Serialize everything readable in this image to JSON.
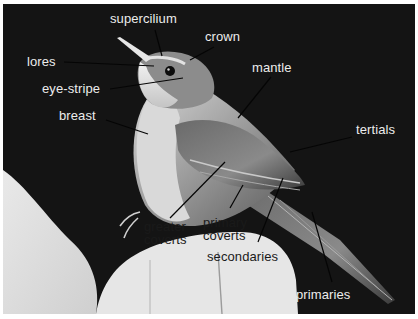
{
  "figure": {
    "background_color": "#141414",
    "label_color_light": "#ececec",
    "label_color_dark": "#1a1a1a"
  },
  "labels": [
    {
      "id": "supercilium",
      "text": "supercilium",
      "x": 110,
      "y": 12,
      "tone": "light",
      "line": [
        155,
        30,
        162,
        56
      ]
    },
    {
      "id": "crown",
      "text": "crown",
      "x": 205,
      "y": 30,
      "tone": "light",
      "line": [
        214,
        47,
        190,
        60
      ]
    },
    {
      "id": "lores",
      "text": "lores",
      "x": 27,
      "y": 55,
      "tone": "light",
      "line": [
        64,
        62,
        154,
        66
      ]
    },
    {
      "id": "mantle",
      "text": "mantle",
      "x": 252,
      "y": 61,
      "tone": "light",
      "line": [
        271,
        77,
        238,
        118
      ]
    },
    {
      "id": "eye-stripe",
      "text": "eye-stripe",
      "x": 42,
      "y": 82,
      "tone": "light",
      "line": [
        110,
        89,
        183,
        78
      ]
    },
    {
      "id": "breast",
      "text": "breast",
      "x": 59,
      "y": 109,
      "tone": "light",
      "line": [
        106,
        120,
        148,
        134
      ]
    },
    {
      "id": "tertials",
      "text": "tertials",
      "x": 356,
      "y": 123,
      "tone": "light",
      "line": [
        352,
        137,
        290,
        152
      ]
    },
    {
      "id": "greater-coverts",
      "text": [
        "greater",
        "coverts"
      ],
      "x": 144,
      "y": 222,
      "tone": "dark",
      "line": [
        170,
        218,
        225,
        162
      ]
    },
    {
      "id": "primary-coverts",
      "text": [
        "primary",
        "coverts"
      ],
      "x": 203,
      "y": 218,
      "tone": "dark",
      "line": [
        230,
        208,
        243,
        185
      ]
    },
    {
      "id": "secondaries",
      "text": "secondaries",
      "x": 207,
      "y": 250,
      "tone": "dark",
      "line": [
        258,
        242,
        283,
        178
      ]
    },
    {
      "id": "primaries",
      "text": "primaries",
      "x": 296,
      "y": 288,
      "tone": "light",
      "line": [
        332,
        282,
        312,
        212
      ]
    }
  ],
  "label_text": {
    "supercilium": "supercilium",
    "crown": "crown",
    "lores": "lores",
    "mantle": "mantle",
    "eye_stripe": "eye-stripe",
    "breast": "breast",
    "tertials": "tertials",
    "greater_coverts_1": "greater",
    "greater_coverts_2": "coverts",
    "primary_coverts_1": "primary",
    "primary_coverts_2": "coverts",
    "secondaries": "secondaries",
    "primaries": "primaries"
  }
}
